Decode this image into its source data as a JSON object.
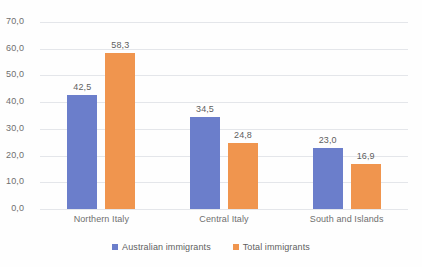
{
  "chart_data": {
    "type": "bar",
    "title": "",
    "xlabel": "",
    "ylabel": "",
    "categories": [
      "Northern Italy",
      "Central Italy",
      "South and Islands"
    ],
    "series": [
      {
        "name": "Australian immigrants",
        "color": "#6b7ecb",
        "values": [
          42.5,
          34.5,
          23.0
        ],
        "labels": [
          "42,5",
          "34,5",
          "23,0"
        ]
      },
      {
        "name": "Total immigrants",
        "color": "#f0954e",
        "values": [
          58.3,
          24.8,
          16.9
        ],
        "labels": [
          "58,3",
          "24,8",
          "16,9"
        ]
      }
    ],
    "ylim": [
      0,
      70
    ],
    "ytick_step": 10,
    "ytick_labels": [
      "0,0",
      "10,0",
      "20,0",
      "30,0",
      "40,0",
      "50,0",
      "60,0",
      "70,0"
    ],
    "ytick_values": [
      0,
      10,
      20,
      30,
      40,
      50,
      60,
      70
    ],
    "decimal_separator": ",",
    "grid": "horizontal",
    "legend_position": "bottom",
    "data_labels": true,
    "gridline_color": "#e4e6ea",
    "background_color": "#ffffff"
  }
}
